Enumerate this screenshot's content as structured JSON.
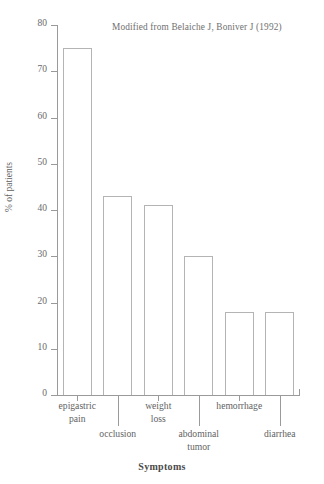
{
  "chart_data": {
    "type": "bar",
    "title": "",
    "subtitle": "",
    "annotation": "Modified from Belaiche J, Boniver J (1992)",
    "xlabel": "Symptoms",
    "ylabel": "% of patients",
    "ylim": [
      0,
      80
    ],
    "ytick_step": 10,
    "yticks": [
      0,
      10,
      20,
      30,
      40,
      50,
      60,
      70,
      80
    ],
    "ytick_labels": [
      "0",
      "10",
      "20",
      "30",
      "40",
      "50",
      "60",
      "70",
      "80"
    ],
    "grid": false,
    "legend": null,
    "categories": [
      "epigastric pain",
      "occlusion",
      "weight loss",
      "abdominal tumor",
      "hemorrhage",
      "diarrhea"
    ],
    "category_lines": [
      [
        "epigastric",
        "pain"
      ],
      [
        "occlusion"
      ],
      [
        "weight",
        "loss"
      ],
      [
        "abdominal",
        "tumor"
      ],
      [
        "hemorrhage"
      ],
      [
        "diarrhea"
      ]
    ],
    "values": [
      75,
      43,
      41,
      30,
      18,
      18
    ],
    "bar_facecolor": "#ffffff",
    "bar_edgecolor": "#b4b4b4",
    "axis_color": "#9a9a9a",
    "text_color": "#5f5f5f",
    "background": "#ffffff"
  },
  "figure": {
    "annotation": "Modified from Belaiche J, Boniver J (1992)",
    "xlabel": "Symptoms",
    "ylabel": "% of patients"
  }
}
